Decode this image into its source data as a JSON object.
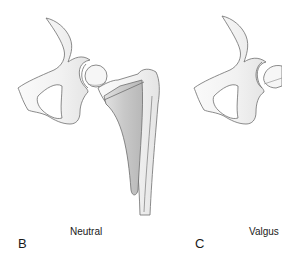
{
  "figure": {
    "colors": {
      "bone_fill": "#f4f4f4",
      "bone_stroke": "#6e6e6e",
      "implant_fill": "#cfcfcf",
      "implant_shade": "#bdbdbd",
      "background": "#ffffff",
      "text": "#1a1a1a"
    },
    "panels": [
      {
        "letter": "B",
        "caption": "Neutral"
      },
      {
        "letter": "C",
        "caption": "Valgus"
      }
    ]
  }
}
